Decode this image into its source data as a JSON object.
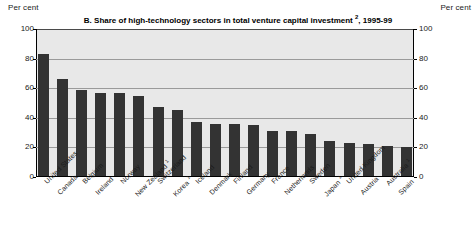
{
  "header": {
    "left_unit": "Per cent",
    "right_unit": "Per cent"
  },
  "chart_data": {
    "type": "bar",
    "title_footnote": "2",
    "xlabel": "",
    "ylabel": "Per cent",
    "ylim": [
      0,
      100
    ],
    "yticks": [
      0,
      20,
      40,
      60,
      80,
      100
    ],
    "ytick_labels": [
      "0",
      "20",
      "40",
      "60",
      "80",
      "100"
    ],
    "grid": true,
    "legend": null,
    "bar_color": "#333333",
    "plot_background": "#e8e8e8",
    "categories": [
      "United States",
      "Canada",
      "Belgium",
      "Ireland",
      "Norway",
      "New Zealand ¹",
      "Switzerland",
      "Korea ¹",
      "Iceland",
      "Denmark",
      "Finland",
      "Germany",
      "France",
      "Netherlands",
      "Sweden",
      "Japan ¹",
      "United Kingdom",
      "Austria",
      "Australia ¹",
      "Spain"
    ],
    "values": [
      83,
      66,
      59,
      57,
      57,
      55,
      47,
      45,
      37,
      36,
      36,
      35,
      31,
      31,
      29,
      24,
      23,
      22,
      21,
      20
    ]
  }
}
